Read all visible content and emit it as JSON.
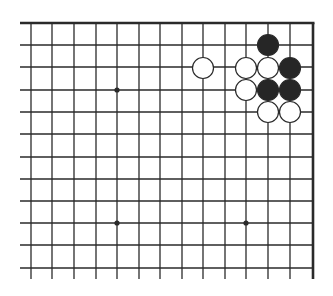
{
  "diagram": {
    "type": "go-board-fragment",
    "colors": {
      "line": "#2a2a2a",
      "black_stone": "#262626",
      "white_stone": "#ffffff",
      "stone_outline": "#2a2a2a",
      "background": "#ffffff"
    },
    "grid": {
      "x_lines": [
        31,
        52,
        74,
        96,
        117,
        139,
        160,
        182,
        203,
        225,
        246,
        268,
        290
      ],
      "y_lines": [
        23,
        45,
        67,
        90,
        112,
        134,
        157,
        179,
        201,
        223,
        245,
        268
      ],
      "left_extent": 20,
      "bottom_extent": 279,
      "top_edge_y": 23,
      "right_edge_x": 313
    },
    "hoshi": [
      {
        "x": 117,
        "y": 90
      },
      {
        "x": 117,
        "y": 223
      },
      {
        "x": 246,
        "y": 223
      }
    ],
    "stones": [
      {
        "color": "black",
        "x": 268,
        "y": 45
      },
      {
        "color": "white",
        "x": 203,
        "y": 68
      },
      {
        "color": "white",
        "x": 246,
        "y": 68
      },
      {
        "color": "white",
        "x": 268,
        "y": 68
      },
      {
        "color": "black",
        "x": 290,
        "y": 68
      },
      {
        "color": "white",
        "x": 246,
        "y": 90
      },
      {
        "color": "black",
        "x": 268,
        "y": 90
      },
      {
        "color": "black",
        "x": 290,
        "y": 90
      },
      {
        "color": "white",
        "x": 268,
        "y": 112
      },
      {
        "color": "white",
        "x": 290,
        "y": 112
      }
    ],
    "stone_radius": 10.5
  }
}
